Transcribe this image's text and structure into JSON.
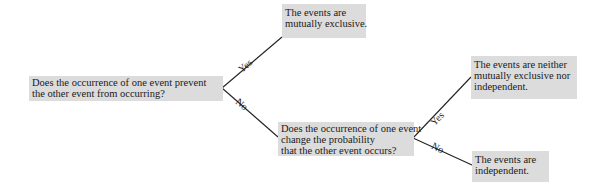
{
  "diagram": {
    "type": "decision-tree",
    "nodes": {
      "q1": {
        "lines": [
          "Does the occurrence of one event prevent",
          "the other event from occurring?"
        ]
      },
      "r_mutually_exclusive": {
        "lines": [
          "The events are",
          "mutually exclusive."
        ]
      },
      "q2": {
        "lines": [
          "Does the occurrence of one event",
          "change the probability",
          "that the other event occurs?"
        ]
      },
      "r_neither": {
        "lines": [
          "The events are neither",
          "mutually exclusive  nor",
          "independent."
        ]
      },
      "r_independent": {
        "lines": [
          "The events are",
          "independent."
        ]
      }
    },
    "edges": {
      "q1_yes": "Yes",
      "q1_no": "No",
      "q2_yes": "Yes",
      "q2_no": "No"
    },
    "colors": {
      "box_fill": "#dcdcdc",
      "line": "#222222"
    }
  }
}
